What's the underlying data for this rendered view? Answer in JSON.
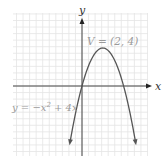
{
  "chart_data": {
    "type": "line",
    "title": "",
    "xlabel": "x",
    "ylabel": "y",
    "equation_label": "y = −x² + 4x",
    "vertex_label": "V = (2, 4)",
    "vertex": [
      2,
      4
    ],
    "x_intercepts": [
      0,
      4
    ],
    "xlim": [
      -6.5,
      6.5
    ],
    "ylim": [
      -7,
      6.5
    ],
    "grid": true,
    "series": [
      {
        "name": "y = -x^2 + 4x",
        "x": [
          -0.9,
          -0.5,
          0,
          0.5,
          1,
          1.5,
          2,
          2.5,
          3,
          3.5,
          4,
          4.5,
          4.9
        ],
        "values": [
          -4.41,
          -2.25,
          0,
          1.75,
          3,
          3.75,
          4,
          3.75,
          3,
          1.75,
          0,
          -2.25,
          -4.41
        ]
      }
    ]
  },
  "colors": {
    "curve": "#555555",
    "axis": "#444444",
    "grid": "#e4e4e4",
    "label": "#9a9a9a"
  },
  "labels": {
    "x_axis": "x",
    "y_axis": "y",
    "vertex": "V = (2, 4)",
    "equation_y": "y = −x",
    "equation_exp": "2",
    "equation_rest": " + 4x"
  }
}
